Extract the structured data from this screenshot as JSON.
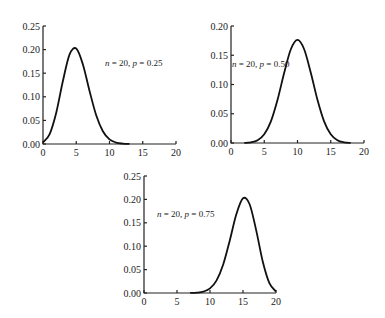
{
  "chart_data": [
    {
      "type": "line",
      "title": "",
      "annotation": "n = 20, p = 0.25",
      "xlabel": "",
      "ylabel": "",
      "xlim": [
        0,
        20
      ],
      "ylim": [
        0,
        0.25
      ],
      "x_ticks": [
        "0",
        "5",
        "10",
        "15",
        "20"
      ],
      "y_ticks": [
        "0.00",
        "0.05",
        "0.10",
        "0.15",
        "0.20",
        "0.25"
      ],
      "grid": false,
      "x": [
        0,
        1,
        2,
        3,
        4,
        5,
        6,
        7,
        8,
        9,
        10,
        11,
        12,
        13,
        14,
        15,
        16,
        17,
        18,
        19,
        20
      ],
      "series": [
        {
          "name": "n=20, p=0.25",
          "values": [
            0.0032,
            0.0211,
            0.0669,
            0.1339,
            0.1897,
            0.2023,
            0.1686,
            0.1124,
            0.0609,
            0.0271,
            0.0099,
            0.003,
            0.0008,
            0.0002,
            0.0,
            0.0,
            0.0,
            0.0,
            0.0,
            0.0,
            0.0
          ]
        }
      ]
    },
    {
      "type": "line",
      "title": "",
      "annotation": "n = 20, p = 0.50",
      "xlabel": "",
      "ylabel": "",
      "xlim": [
        0,
        20
      ],
      "ylim": [
        0,
        0.2
      ],
      "x_ticks": [
        "0",
        "5",
        "10",
        "15",
        "20"
      ],
      "y_ticks": [
        "0.00",
        "0.05",
        "0.10",
        "0.15",
        "0.20"
      ],
      "grid": false,
      "x": [
        0,
        1,
        2,
        3,
        4,
        5,
        6,
        7,
        8,
        9,
        10,
        11,
        12,
        13,
        14,
        15,
        16,
        17,
        18,
        19,
        20
      ],
      "series": [
        {
          "name": "n=20, p=0.50",
          "values": [
            0.0,
            0.0,
            0.0002,
            0.0011,
            0.0046,
            0.0148,
            0.037,
            0.0739,
            0.1201,
            0.1602,
            0.1762,
            0.1602,
            0.1201,
            0.0739,
            0.037,
            0.0148,
            0.0046,
            0.0011,
            0.0002,
            0.0,
            0.0
          ]
        }
      ]
    },
    {
      "type": "line",
      "title": "",
      "annotation": "n = 20, p = 0.75",
      "xlabel": "",
      "ylabel": "",
      "xlim": [
        0,
        20
      ],
      "ylim": [
        0,
        0.25
      ],
      "x_ticks": [
        "0",
        "5",
        "10",
        "15",
        "20"
      ],
      "y_ticks": [
        "0.00",
        "0.05",
        "0.10",
        "0.15",
        "0.20",
        "0.25"
      ],
      "grid": false,
      "x": [
        0,
        1,
        2,
        3,
        4,
        5,
        6,
        7,
        8,
        9,
        10,
        11,
        12,
        13,
        14,
        15,
        16,
        17,
        18,
        19,
        20
      ],
      "series": [
        {
          "name": "n=20, p=0.75",
          "values": [
            0.0,
            0.0,
            0.0,
            0.0,
            0.0,
            0.0,
            0.0,
            0.0002,
            0.0008,
            0.003,
            0.0099,
            0.0271,
            0.0609,
            0.1124,
            0.1686,
            0.2023,
            0.1897,
            0.1339,
            0.0669,
            0.0211,
            0.0032
          ]
        }
      ]
    }
  ],
  "layout": [
    {
      "x0": 43,
      "x1": 176,
      "y0": 144,
      "y1": 26,
      "ymax": 0.25,
      "ann_x": 105,
      "ann_y": 66
    },
    {
      "x0": 231,
      "x1": 364,
      "y0": 143,
      "y1": 26,
      "ymax": 0.2,
      "ann_x": 232,
      "ann_y": 67
    },
    {
      "x0": 144,
      "x1": 276,
      "y0": 293,
      "y1": 176,
      "ymax": 0.25,
      "ann_x": 157,
      "ann_y": 217
    }
  ]
}
